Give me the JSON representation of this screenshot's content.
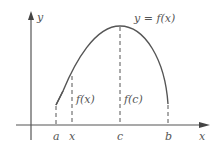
{
  "figure": {
    "curve_label": "y = f(x)",
    "y_axis_label": "y",
    "x_axis_label": "x",
    "ticks": [
      {
        "label": "a"
      },
      {
        "label": "x"
      },
      {
        "label": "c"
      },
      {
        "label": "b"
      }
    ],
    "segment_labels": {
      "fx": "f(x)",
      "fc": "f(c)"
    },
    "colors": {
      "stroke": "#555555",
      "background": "#ffffff"
    }
  }
}
